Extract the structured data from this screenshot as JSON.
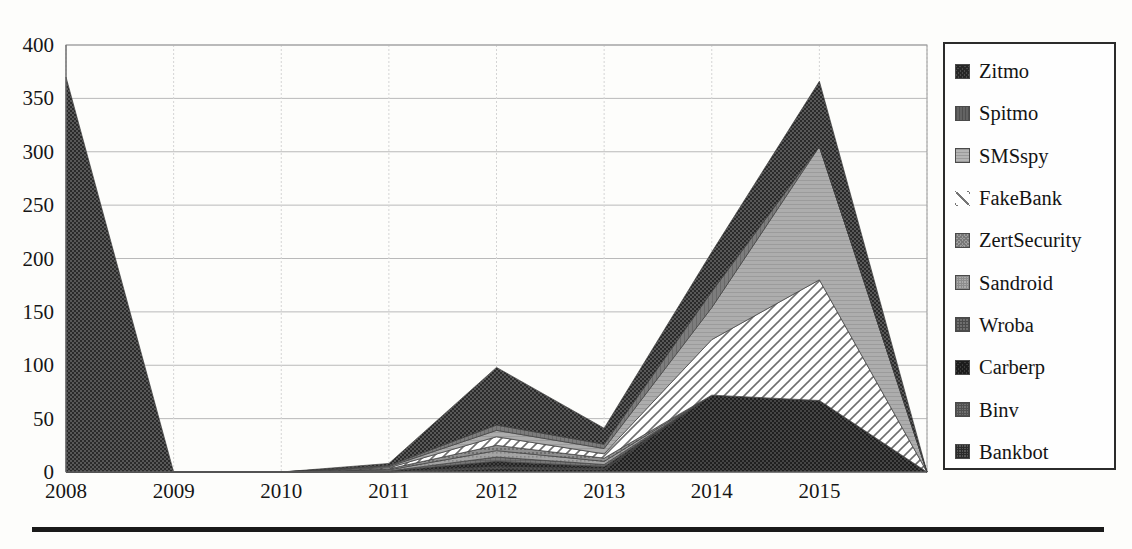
{
  "chart_data": {
    "type": "area",
    "stacked": true,
    "title": "",
    "xlabel": "",
    "ylabel": "",
    "ylim": [
      0,
      400
    ],
    "ytick_values": [
      0,
      50,
      100,
      150,
      200,
      250,
      300,
      350,
      400
    ],
    "ytick_labels": [
      "0",
      "50",
      "100",
      "150",
      "200",
      "250",
      "300",
      "350",
      "400"
    ],
    "grid": true,
    "legend_position": "right",
    "categories": [
      "2008",
      "2009",
      "2010",
      "2011",
      "2012",
      "2013",
      "2014",
      "2015",
      "2016"
    ],
    "x": [
      2008,
      2009,
      2010,
      2011,
      2012,
      2013,
      2014,
      2015,
      2016
    ],
    "series": [
      {
        "name": "Bankbot",
        "color": "#3a3a3a",
        "pattern": "dense-dot",
        "values": [
          0,
          0,
          0,
          0,
          3,
          2,
          72,
          67,
          0
        ]
      },
      {
        "name": "Binv",
        "color": "#555555",
        "pattern": "dot",
        "values": [
          0,
          0,
          0,
          0,
          2,
          1,
          0,
          0,
          0
        ]
      },
      {
        "name": "Carberp",
        "color": "#2f2f2f",
        "pattern": "crosshatch",
        "values": [
          0,
          0,
          0,
          1,
          5,
          2,
          0,
          0,
          0
        ]
      },
      {
        "name": "Wroba",
        "color": "#6d6d6d",
        "pattern": "grid",
        "values": [
          0,
          0,
          0,
          0,
          4,
          2,
          0,
          0,
          0
        ]
      },
      {
        "name": "Sandroid",
        "color": "#9a9a9a",
        "pattern": "light-dot",
        "values": [
          0,
          0,
          0,
          1,
          6,
          3,
          0,
          0,
          0
        ]
      },
      {
        "name": "ZertSecurity",
        "color": "#8c8c8c",
        "pattern": "mid-dot",
        "values": [
          0,
          0,
          0,
          1,
          5,
          3,
          0,
          0,
          0
        ]
      },
      {
        "name": "FakeBank",
        "color": "#ffffff",
        "pattern": "diagonal",
        "values": [
          0,
          0,
          0,
          1,
          8,
          4,
          52,
          113,
          0
        ]
      },
      {
        "name": "SMSspy",
        "color": "#a8a8a8",
        "pattern": "light-fill",
        "values": [
          0,
          0,
          0,
          1,
          6,
          5,
          30,
          125,
          0
        ]
      },
      {
        "name": "Spitmo",
        "color": "#777777",
        "pattern": "solid-gray",
        "values": [
          0,
          0,
          0,
          1,
          5,
          4,
          15,
          0,
          0
        ]
      },
      {
        "name": "Zitmo",
        "color": "#4a4a4a",
        "pattern": "dark-dot",
        "values": [
          370,
          0,
          0,
          2,
          54,
          15,
          37,
          61,
          0
        ]
      }
    ],
    "stack_order_bottom_to_top": [
      "Bankbot",
      "Binv",
      "Carberp",
      "Wroba",
      "Sandroid",
      "ZertSecurity",
      "FakeBank",
      "SMSspy",
      "Spitmo",
      "Zitmo"
    ],
    "totals": [
      370,
      0,
      0,
      8,
      98,
      41,
      206,
      366,
      0
    ]
  },
  "legend": {
    "items": [
      {
        "label": "Zitmo",
        "swatch": "dark-crosshatch-swatch"
      },
      {
        "label": "Spitmo",
        "swatch": "dark-gray-swatch"
      },
      {
        "label": "SMSspy",
        "swatch": "light-gray-swatch"
      },
      {
        "label": "FakeBank",
        "swatch": "diagonal-line-swatch"
      },
      {
        "label": "ZertSecurity",
        "swatch": "mid-gray-texture-swatch"
      },
      {
        "label": "Sandroid",
        "swatch": "light-dot-swatch"
      },
      {
        "label": "Wroba",
        "swatch": "gray-grid-swatch"
      },
      {
        "label": "Carberp",
        "swatch": "dark-crosshatch-swatch"
      },
      {
        "label": "Binv",
        "swatch": "mid-dot-swatch"
      },
      {
        "label": "Bankbot",
        "swatch": "dark-dot-swatch"
      }
    ]
  }
}
